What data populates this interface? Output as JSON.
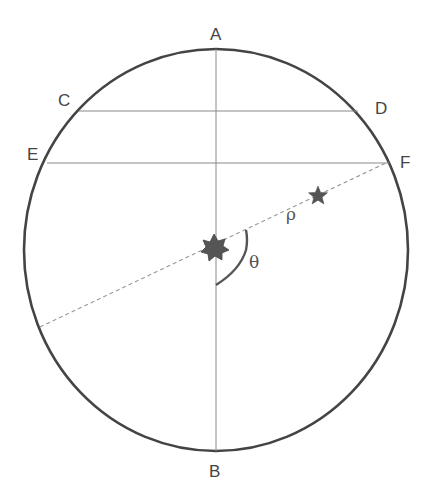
{
  "diagram": {
    "type": "celestial-position-angle",
    "colors": {
      "outline": "#444444",
      "chord": "#8a8a8a",
      "dashed": "#9a9a9a",
      "star": "#555555",
      "text": "#444444"
    },
    "ellipse": {
      "cx": 216,
      "cy": 250,
      "rx": 192,
      "ry": 201
    },
    "points": {
      "A": {
        "label": "A",
        "x": 210,
        "y": 8
      },
      "B": {
        "label": "B",
        "x": 209,
        "y": 467
      },
      "C": {
        "label": "C",
        "x": 58,
        "y": 94
      },
      "D": {
        "label": "D",
        "x": 375,
        "y": 102
      },
      "E": {
        "label": "E",
        "x": 28,
        "y": 149
      },
      "F": {
        "label": "F",
        "x": 400,
        "y": 156
      }
    },
    "lines": {
      "vertical_AB": {
        "x1": 216,
        "y1": 49,
        "x2": 216,
        "y2": 451
      },
      "chord_CD": {
        "x1": 79,
        "y1": 111,
        "x2": 358,
        "y2": 111
      },
      "chord_EF": {
        "x1": 47,
        "y1": 163,
        "x2": 389,
        "y2": 163
      },
      "dashed_radius": {
        "x1": 40,
        "y1": 327,
        "x2": 386,
        "y2": 163
      }
    },
    "angle_arc": {
      "label": "θ",
      "x": 248,
      "y": 258
    },
    "rho": {
      "label": "ρ",
      "x": 286,
      "y": 209
    },
    "primary_star": {
      "name": "primary-star",
      "cx": 214,
      "cy": 246,
      "points": 7
    },
    "companion_star": {
      "name": "companion-star",
      "cx": 318,
      "cy": 195,
      "points": 5
    }
  }
}
